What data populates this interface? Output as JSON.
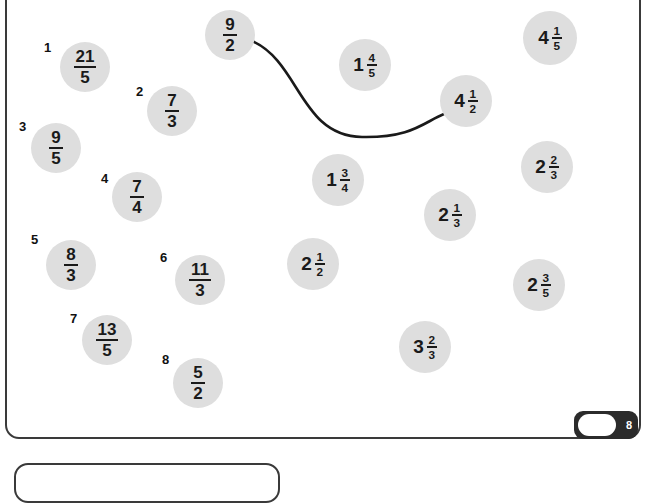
{
  "page": {
    "number": "8",
    "background": "#ffffff",
    "frame_color": "#3a3a3a",
    "bubble_color": "#dedede",
    "ink_color": "#1a1a1a"
  },
  "index_labels": [
    {
      "text": "1",
      "x": 44,
      "y": 40
    },
    {
      "text": "2",
      "x": 136,
      "y": 84
    },
    {
      "text": "3",
      "x": 19,
      "y": 119
    },
    {
      "text": "4",
      "x": 101,
      "y": 171
    },
    {
      "text": "5",
      "x": 31,
      "y": 232
    },
    {
      "text": "6",
      "x": 160,
      "y": 250
    },
    {
      "text": "7",
      "x": 70,
      "y": 311
    },
    {
      "text": "8",
      "x": 162,
      "y": 352
    }
  ],
  "improper_fractions": [
    {
      "name": "fraction-21-5",
      "numerator": "21",
      "denominator": "5",
      "cx": 85,
      "cy": 67,
      "r": 25
    },
    {
      "name": "fraction-7-3",
      "numerator": "7",
      "denominator": "3",
      "cx": 172,
      "cy": 111,
      "r": 25
    },
    {
      "name": "fraction-9-5",
      "numerator": "9",
      "denominator": "5",
      "cx": 56,
      "cy": 148,
      "r": 25
    },
    {
      "name": "fraction-7-4",
      "numerator": "7",
      "denominator": "4",
      "cx": 137,
      "cy": 197,
      "r": 25
    },
    {
      "name": "fraction-8-3",
      "numerator": "8",
      "denominator": "3",
      "cx": 71,
      "cy": 265,
      "r": 25
    },
    {
      "name": "fraction-11-3",
      "numerator": "11",
      "denominator": "3",
      "cx": 200,
      "cy": 280,
      "r": 25
    },
    {
      "name": "fraction-13-5",
      "numerator": "13",
      "denominator": "5",
      "cx": 107,
      "cy": 340,
      "r": 25
    },
    {
      "name": "fraction-5-2",
      "numerator": "5",
      "denominator": "2",
      "cx": 198,
      "cy": 383,
      "r": 25
    },
    {
      "name": "fraction-9-2",
      "numerator": "9",
      "denominator": "2",
      "cx": 230,
      "cy": 35,
      "r": 25
    }
  ],
  "mixed_numbers": [
    {
      "name": "mixed-1-4-5",
      "whole": "1",
      "numerator": "4",
      "denominator": "5",
      "cx": 365,
      "cy": 65,
      "r": 26
    },
    {
      "name": "mixed-4-1-5",
      "whole": "4",
      "numerator": "1",
      "denominator": "5",
      "cx": 550,
      "cy": 38,
      "r": 27
    },
    {
      "name": "mixed-4-1-2",
      "whole": "4",
      "numerator": "1",
      "denominator": "2",
      "cx": 466,
      "cy": 101,
      "r": 26
    },
    {
      "name": "mixed-1-3-4",
      "whole": "1",
      "numerator": "3",
      "denominator": "4",
      "cx": 338,
      "cy": 180,
      "r": 26
    },
    {
      "name": "mixed-2-2-3",
      "whole": "2",
      "numerator": "2",
      "denominator": "3",
      "cx": 547,
      "cy": 167,
      "r": 26
    },
    {
      "name": "mixed-2-1-3",
      "whole": "2",
      "numerator": "1",
      "denominator": "3",
      "cx": 450,
      "cy": 215,
      "r": 26
    },
    {
      "name": "mixed-2-1-2",
      "whole": "2",
      "numerator": "1",
      "denominator": "2",
      "cx": 313,
      "cy": 264,
      "r": 26
    },
    {
      "name": "mixed-2-3-5",
      "whole": "2",
      "numerator": "3",
      "denominator": "5",
      "cx": 539,
      "cy": 285,
      "r": 26
    },
    {
      "name": "mixed-3-2-3",
      "whole": "3",
      "numerator": "2",
      "denominator": "3",
      "cx": 425,
      "cy": 347,
      "r": 26
    }
  ],
  "connector": {
    "name": "matching-line-9-2-to-4-1-2",
    "path": "M 252 41 C 300 62 300 136 362 137 C 412 138 424 122 444 114",
    "stroke": "#1a1a1a",
    "width": 2.6
  }
}
